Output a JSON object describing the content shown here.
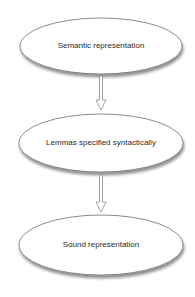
{
  "diagram": {
    "type": "flowchart",
    "direction": "top-to-bottom",
    "colors": {
      "node_fill": "#ffffff",
      "node_stroke": "#6e6e6e",
      "node_shadow": "#9a9a9a",
      "arrow_fill": "#ffffff",
      "arrow_stroke": "#8a8a8a",
      "text": "#2a2a2a"
    },
    "nodes": [
      {
        "id": "n1",
        "shape": "ellipse",
        "label": "Semantic representation"
      },
      {
        "id": "n2",
        "shape": "ellipse",
        "label": "Lemmas specified syntactically"
      },
      {
        "id": "n3",
        "shape": "ellipse",
        "label": "Sound representation"
      }
    ],
    "edges": [
      {
        "from": "n1",
        "to": "n2",
        "style": "hollow-arrow"
      },
      {
        "from": "n2",
        "to": "n3",
        "style": "hollow-arrow"
      }
    ]
  }
}
